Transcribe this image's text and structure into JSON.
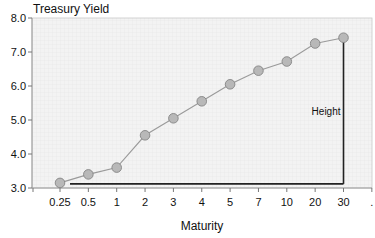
{
  "chart_data": {
    "type": "line",
    "title": "Treasury Yield",
    "xlabel": "Maturity",
    "ylabel": "",
    "categories": [
      "0.25",
      "0.5",
      "1",
      "2",
      "3",
      "4",
      "5",
      "7",
      "10",
      "20",
      "30"
    ],
    "series": [
      {
        "name": "Treasury Yield",
        "values": [
          3.15,
          3.4,
          3.6,
          4.55,
          5.05,
          5.55,
          6.05,
          6.45,
          6.72,
          7.25,
          7.42
        ],
        "line_color": "#9a9a9a",
        "marker_fill": "#b8b8b8",
        "marker_stroke": "#858585"
      }
    ],
    "ylim": [
      3.0,
      8.0
    ],
    "yticks": [
      "3.0",
      "4.0",
      "5.0",
      "6.0",
      "7.0",
      "8.0"
    ],
    "extra_xtick_label": ".",
    "grid": true,
    "annotations": [
      {
        "type": "height-bracket",
        "label": "Height",
        "from_category": "0.25",
        "to_category": "30",
        "baseline_value": 3.15,
        "top_value": 7.42,
        "color": "#222222"
      }
    ]
  }
}
